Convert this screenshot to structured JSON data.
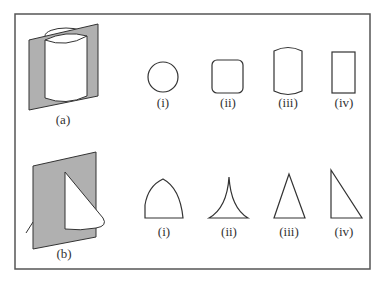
{
  "figure": {
    "colors": {
      "background": "#ffffff",
      "frame": "#555555",
      "stroke": "#333333",
      "plane_fill": "#b0b0b0",
      "solid_fill": "#ffffff"
    },
    "rows": [
      {
        "solid_label": "(a)",
        "solid_description": "cylinder intersected by a vertical plane",
        "cross_sections": [
          {
            "label": "(i)",
            "shape": "circle"
          },
          {
            "label": "(ii)",
            "shape": "rounded-square"
          },
          {
            "label": "(iii)",
            "shape": "barrel"
          },
          {
            "label": "(iv)",
            "shape": "rectangle"
          }
        ]
      },
      {
        "solid_label": "(b)",
        "solid_description": "cone intersected by a vertical plane",
        "cross_sections": [
          {
            "label": "(i)",
            "shape": "arch"
          },
          {
            "label": "(ii)",
            "shape": "concave-cusp"
          },
          {
            "label": "(iii)",
            "shape": "isosceles-triangle"
          },
          {
            "label": "(iv)",
            "shape": "right-triangle"
          }
        ]
      }
    ]
  }
}
